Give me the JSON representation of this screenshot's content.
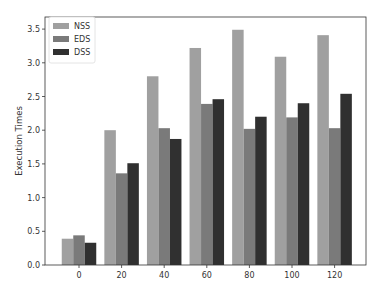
{
  "chart_data": {
    "type": "bar",
    "title": "",
    "xlabel": "",
    "ylabel": "Execution Times",
    "ylim": [
      0,
      3.6
    ],
    "yticks": [
      0.0,
      0.5,
      1.0,
      1.5,
      2.0,
      2.5,
      3.0,
      3.5
    ],
    "ytick_labels": [
      "0.0",
      "0.5",
      "1.0",
      "1.5",
      "2.0",
      "2.5",
      "3.0",
      "3.5"
    ],
    "categories": [
      "0",
      "20",
      "40",
      "60",
      "80",
      "100",
      "120"
    ],
    "grid": false,
    "legend_position": "upper left",
    "series": [
      {
        "name": "NSS",
        "color": "#a0a0a0",
        "values": [
          0.39,
          2.0,
          2.8,
          3.22,
          3.49,
          3.09,
          3.41
        ]
      },
      {
        "name": "EDS",
        "color": "#7a7a7a",
        "values": [
          0.44,
          1.36,
          2.03,
          2.39,
          2.02,
          2.19,
          2.03
        ]
      },
      {
        "name": "DSS",
        "color": "#303030",
        "values": [
          0.33,
          1.51,
          1.87,
          2.46,
          2.2,
          2.4,
          2.54
        ]
      }
    ]
  }
}
